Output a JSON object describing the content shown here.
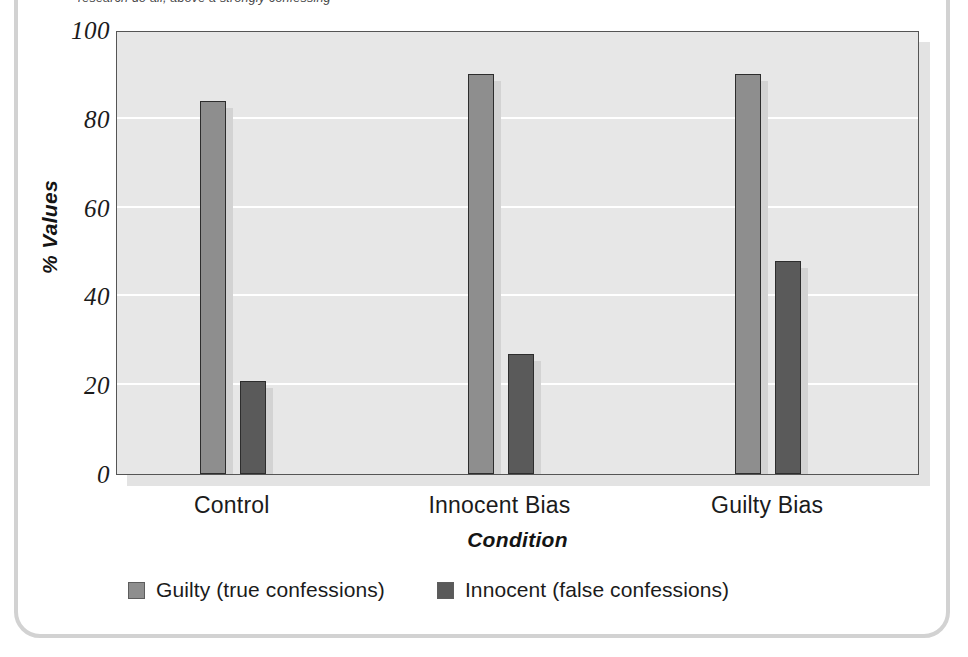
{
  "figure": {
    "caption_top": "research do all, above a strongly confessing",
    "frame_color": "#d2d2d2"
  },
  "chart_data": {
    "type": "bar",
    "title": "",
    "subtitle": "",
    "categories": [
      "Control",
      "Innocent Bias",
      "Guilty Bias"
    ],
    "series": [
      {
        "name": "Guilty (true confessions)",
        "color": "#8e8e8e",
        "values": [
          84,
          90,
          90
        ]
      },
      {
        "name": "Innocent (false confessions)",
        "color": "#5a5a5a",
        "values": [
          21,
          27,
          48
        ]
      }
    ],
    "xlabel": "Condition",
    "ylabel": "% Values",
    "ylim": [
      0,
      100
    ],
    "yticks": [
      0,
      20,
      40,
      60,
      80,
      100
    ],
    "ytick_labels": [
      "0",
      "20",
      "40",
      "60",
      "80",
      "100"
    ],
    "grid": true,
    "grid_axis": "y",
    "grid_color": "#ffffff",
    "legend_position": "bottom-left",
    "plot_background": "#e7e7e7",
    "axis_color": "#555555"
  },
  "legend": {
    "items": [
      {
        "label": "Guilty (true confessions)",
        "color": "#8e8e8e"
      },
      {
        "label": "Innocent (false confessions)",
        "color": "#5a5a5a"
      }
    ]
  }
}
